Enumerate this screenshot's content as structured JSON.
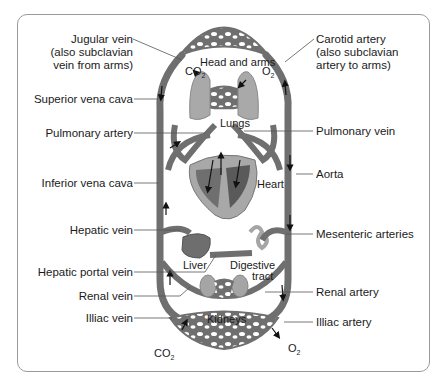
{
  "figure": {
    "type": "circulatory-system-diagram",
    "colors": {
      "vessel": "#6f6f6f",
      "vessel_light": "#a8a8a8",
      "organ": "#8a8a8a",
      "frame_border": "#9a9a9a",
      "text": "#1a1a1a"
    }
  },
  "left_labels": [
    {
      "id": "jugular",
      "lines": [
        "Jugular vein",
        "(also subclavian",
        "vein from arms)"
      ]
    },
    {
      "id": "superior_vena_cava",
      "lines": [
        "Superior vena cava"
      ]
    },
    {
      "id": "pulmonary_artery",
      "lines": [
        "Pulmonary artery"
      ]
    },
    {
      "id": "inferior_vena_cava",
      "lines": [
        "Inferior vena cava"
      ]
    },
    {
      "id": "hepatic_vein",
      "lines": [
        "Hepatic vein"
      ]
    },
    {
      "id": "hepatic_portal_vein",
      "lines": [
        "Hepatic portal vein"
      ]
    },
    {
      "id": "renal_vein",
      "lines": [
        "Renal vein"
      ]
    },
    {
      "id": "illiac_vein",
      "lines": [
        "Illiac vein"
      ]
    }
  ],
  "right_labels": [
    {
      "id": "carotid",
      "lines": [
        "Carotid artery",
        "(also subclavian",
        "artery to arms)"
      ]
    },
    {
      "id": "pulmonary_vein",
      "lines": [
        "Pulmonary vein"
      ]
    },
    {
      "id": "aorta",
      "lines": [
        "Aorta"
      ]
    },
    {
      "id": "mesenteric",
      "lines": [
        "Mesenteric arteries"
      ]
    },
    {
      "id": "renal_artery",
      "lines": [
        "Renal artery"
      ]
    },
    {
      "id": "illiac_artery",
      "lines": [
        "Illiac artery"
      ]
    }
  ],
  "organs": {
    "head_arms": "Head and arms",
    "lungs": "Lungs",
    "heart": "Heart",
    "liver": "Liver",
    "digestive_1": "Digestive",
    "digestive_2": "tract",
    "kidneys": "Kidneys"
  },
  "gases": {
    "co2_base": "CO",
    "co2_sub": "2",
    "o2_base": "O",
    "o2_sub": "2"
  }
}
